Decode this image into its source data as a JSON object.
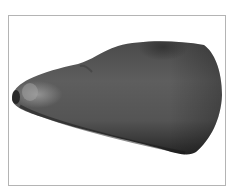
{
  "figure": {
    "colors": {
      "frame_border": "#b4b4b4",
      "background": "#ffffff",
      "body_dark": "#2a2a2a",
      "body_mid": "#5a5a5a",
      "body_light": "#8a8a8a",
      "highlight": "#a8a8a8"
    }
  }
}
